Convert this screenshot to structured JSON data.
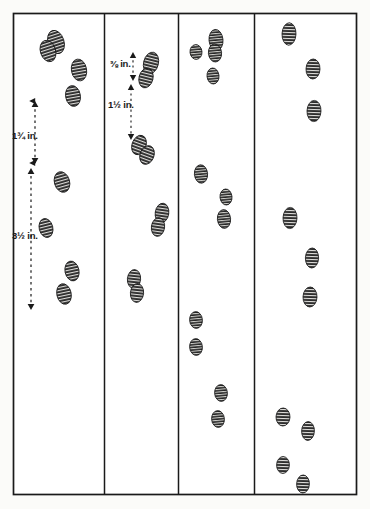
{
  "figure": {
    "background_color": "#fbfbf9",
    "ink_color": "#1a1a1a",
    "frame": {
      "name": "outer-border",
      "x": 13,
      "y": 13,
      "width": 344,
      "height": 482,
      "stroke": "#1a1a1a",
      "stroke_width": 1.6
    },
    "dividers": [
      {
        "name": "divider-1",
        "x": 104
      },
      {
        "name": "divider-2",
        "x": 178
      },
      {
        "name": "divider-3",
        "x": 254
      }
    ],
    "panels": [
      {
        "id": "panel-1",
        "index": 1,
        "x": 13,
        "width": 91,
        "track_count": 7,
        "measurements": [
          "1¾ in.",
          "3½ in."
        ],
        "tracks": [
          {
            "cx": 56,
            "cy": 42,
            "rx": 8.0,
            "ry": 12.0,
            "rot": -18
          },
          {
            "cx": 47,
            "cy": 50,
            "rx": 7.5,
            "ry": 11.0,
            "rot": -18
          },
          {
            "cx": 79,
            "cy": 70,
            "rx": 7.5,
            "ry": 11.0,
            "rot": -12
          },
          {
            "cx": 73,
            "cy": 96,
            "rx": 7.5,
            "ry": 10.5,
            "rot": -12
          },
          {
            "cx": 62,
            "cy": 182,
            "rx": 7.5,
            "ry": 10.5,
            "rot": -14
          },
          {
            "cx": 47,
            "cy": 228,
            "rx": 7.0,
            "ry": 10.0,
            "rot": -14
          },
          {
            "cx": 68,
            "cy": 291,
            "rx": 7.5,
            "ry": 10.5,
            "rot": -14
          },
          {
            "cx": 62,
            "cy": 268,
            "rx": 7.0,
            "ry": 9.5,
            "rot": -14
          }
        ]
      },
      {
        "id": "panel-2",
        "index": 2,
        "x": 104,
        "width": 74,
        "track_count": 6,
        "measurements": [
          "⅜ in.",
          "1½ in."
        ],
        "tracks": [
          {
            "cx": 151,
            "cy": 63,
            "rx": 7.5,
            "ry": 11.0,
            "rot": 14
          },
          {
            "cx": 146,
            "cy": 78,
            "rx": 7.0,
            "ry": 10.0,
            "rot": 14
          },
          {
            "cx": 139,
            "cy": 145,
            "rx": 7.0,
            "ry": 10.0,
            "rot": 18
          },
          {
            "cx": 146,
            "cy": 155,
            "rx": 7.0,
            "ry": 10.0,
            "rot": 18
          },
          {
            "cx": 162,
            "cy": 213,
            "rx": 7.0,
            "ry": 10.0,
            "rot": 10
          },
          {
            "cx": 158,
            "cy": 226,
            "rx": 6.5,
            "ry": 9.5,
            "rot": 10
          },
          {
            "cx": 134,
            "cy": 279,
            "rx": 6.5,
            "ry": 9.5,
            "rot": 8
          },
          {
            "cx": 136,
            "cy": 292,
            "rx": 6.5,
            "ry": 9.5,
            "rot": 8
          }
        ]
      },
      {
        "id": "panel-3",
        "index": 3,
        "x": 178,
        "width": 76,
        "track_count": 9,
        "measurements": [],
        "tracks": [
          {
            "cx": 216,
            "cy": 40,
            "rx": 7.0,
            "ry": 10.5,
            "rot": -6
          },
          {
            "cx": 215,
            "cy": 52,
            "rx": 6.5,
            "ry": 9.0,
            "rot": -6
          },
          {
            "cx": 196,
            "cy": 52,
            "rx": 6.0,
            "ry": 7.5,
            "rot": -6
          },
          {
            "cx": 213,
            "cy": 76,
            "rx": 6.0,
            "ry": 8.0,
            "rot": -6
          },
          {
            "cx": 201,
            "cy": 174,
            "rx": 6.5,
            "ry": 9.0,
            "rot": -6
          },
          {
            "cx": 226,
            "cy": 196,
            "rx": 6.0,
            "ry": 8.0,
            "rot": -6
          },
          {
            "cx": 224,
            "cy": 218,
            "rx": 6.5,
            "ry": 9.5,
            "rot": -6
          },
          {
            "cx": 196,
            "cy": 319,
            "rx": 6.5,
            "ry": 8.5,
            "rot": -6
          },
          {
            "cx": 196,
            "cy": 347,
            "rx": 6.5,
            "ry": 8.5,
            "rot": -6
          },
          {
            "cx": 221,
            "cy": 393,
            "rx": 6.5,
            "ry": 8.5,
            "rot": -6
          },
          {
            "cx": 218,
            "cy": 418,
            "rx": 6.5,
            "ry": 8.5,
            "rot": -6
          }
        ]
      },
      {
        "id": "panel-4",
        "index": 4,
        "x": 254,
        "width": 103,
        "track_count": 9,
        "measurements": [],
        "tracks": [
          {
            "cx": 289,
            "cy": 34,
            "rx": 7.0,
            "ry": 11.0,
            "rot": 0
          },
          {
            "cx": 313,
            "cy": 69,
            "rx": 7.0,
            "ry": 10.0,
            "rot": 0
          },
          {
            "cx": 314,
            "cy": 111,
            "rx": 7.0,
            "ry": 10.5,
            "rot": 0
          },
          {
            "cx": 290,
            "cy": 218,
            "rx": 7.0,
            "ry": 10.5,
            "rot": 0
          },
          {
            "cx": 312,
            "cy": 258,
            "rx": 6.5,
            "ry": 10.0,
            "rot": 0
          },
          {
            "cx": 310,
            "cy": 297,
            "rx": 7.0,
            "ry": 10.0,
            "rot": 0
          },
          {
            "cx": 283,
            "cy": 417,
            "rx": 7.0,
            "ry": 9.0,
            "rot": 0
          },
          {
            "cx": 308,
            "cy": 431,
            "rx": 6.5,
            "ry": 9.5,
            "rot": 0
          },
          {
            "cx": 283,
            "cy": 465,
            "rx": 6.5,
            "ry": 8.5,
            "rot": 0
          },
          {
            "cx": 303,
            "cy": 484,
            "rx": 6.5,
            "ry": 9.0,
            "rot": 0
          }
        ]
      }
    ],
    "annotations": [
      {
        "id": "measure-1",
        "panel": 1,
        "label": "1¾ in.",
        "label_x": 12,
        "label_y": 131,
        "arrow_x": 35,
        "arrow_top": 100,
        "arrow_bottom": 165,
        "style": "dashed-double-arrow"
      },
      {
        "id": "measure-2",
        "panel": 1,
        "label": "3½ in.",
        "label_x": 12,
        "label_y": 231,
        "arrow_x": 30,
        "arrow_top": 168,
        "arrow_bottom": 312,
        "style": "dashed-double-arrow"
      },
      {
        "id": "measure-3",
        "panel": 2,
        "label": "⅜ in.",
        "label_x": 110,
        "label_y": 59,
        "arrow_x": 133,
        "arrow_top": 52,
        "arrow_bottom": 81,
        "style": "dashed-double-arrow"
      },
      {
        "id": "measure-4",
        "panel": 2,
        "label": "1½ in.",
        "label_x": 108,
        "label_y": 100,
        "arrow_x": 131,
        "arrow_top": 84,
        "arrow_bottom": 140,
        "style": "dashed-double-arrow"
      }
    ]
  }
}
